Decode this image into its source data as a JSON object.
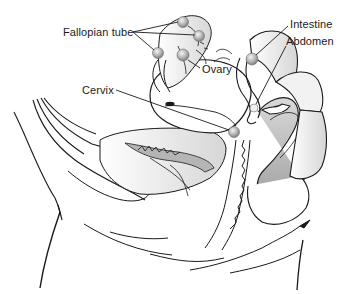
{
  "diagram": {
    "type": "anatomical-illustration",
    "labels": [
      {
        "id": "fallopian-tube",
        "text": "Fallopian tube",
        "x": 63,
        "y": 28
      },
      {
        "id": "ovary",
        "text": "Ovary",
        "x": 202,
        "y": 64
      },
      {
        "id": "intestine",
        "text": "Intestine",
        "x": 290,
        "y": 20
      },
      {
        "id": "abdomen",
        "text": "Abdomen",
        "x": 286,
        "y": 38
      },
      {
        "id": "cervix",
        "text": "Cervix",
        "x": 82,
        "y": 86
      }
    ],
    "colors": {
      "line": "#1a1a1a",
      "shade_light": "#e4e4e4",
      "shade_mid": "#bdbdbd",
      "shade_dark": "#9a9a9a",
      "background": "#ffffff"
    }
  }
}
